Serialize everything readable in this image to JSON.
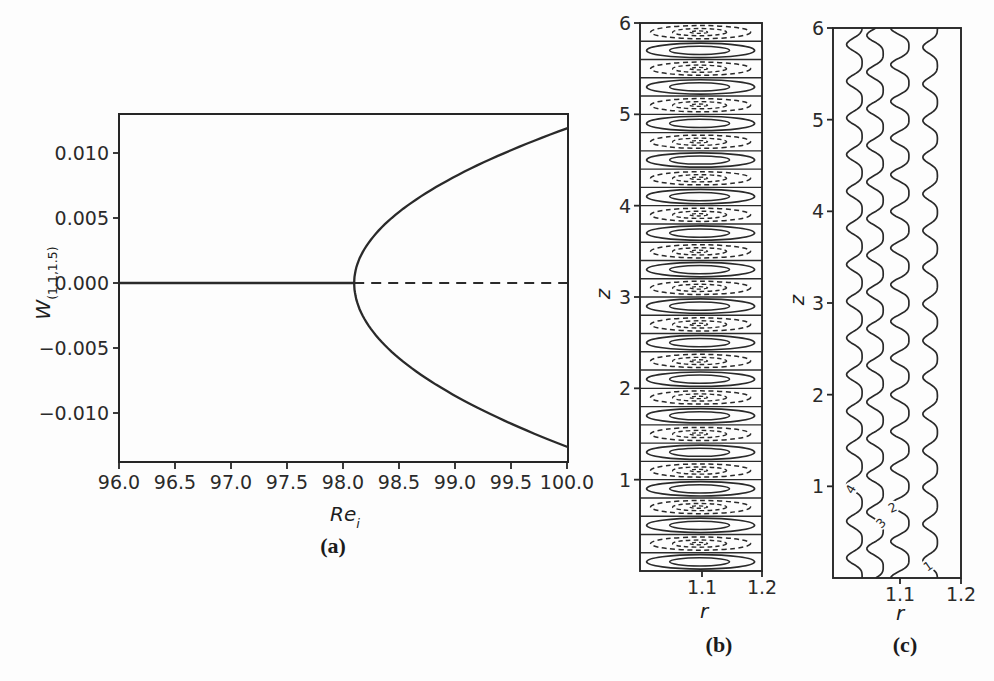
{
  "panels": {
    "a": {
      "caption": "(a)",
      "xlabel": {
        "main": "Re",
        "sub": "i"
      },
      "ylabel": {
        "main": "W",
        "sub": "(1.1,1.5)"
      },
      "xtick_labels": [
        "96.0",
        "96.5",
        "97.0",
        "97.5",
        "98.0",
        "98.5",
        "99.0",
        "99.5",
        "100.0"
      ],
      "ytick_labels": [
        "0.010",
        "0.005",
        "0.000",
        "−0.005",
        "−0.010"
      ]
    },
    "b": {
      "caption": "(b)",
      "xlabel": "r",
      "ylabel": "z",
      "xtick_labels": [
        "1.1",
        "1.2"
      ],
      "ytick_labels": [
        "1",
        "2",
        "3",
        "4",
        "5",
        "6"
      ]
    },
    "c": {
      "caption": "(c)",
      "xlabel": "r",
      "ylabel": "z",
      "xtick_labels": [
        "1.1",
        "1.2"
      ],
      "ytick_labels": [
        "1",
        "2",
        "3",
        "4",
        "5",
        "6"
      ]
    }
  },
  "colors": {
    "line": "#2a2a2a",
    "spine": "#262626",
    "text": "#222222",
    "background": "#fdfdfd"
  },
  "chart_data": [
    {
      "id": "a",
      "type": "line",
      "title": "pitchfork bifurcation diagram",
      "xlabel": "Re_i",
      "ylabel": "W_(1.1,1.5)",
      "xlim": [
        96.0,
        100.0
      ],
      "ylim": [
        -0.0135,
        0.013
      ],
      "xticks": [
        96.0,
        96.5,
        97.0,
        97.5,
        98.0,
        98.5,
        99.0,
        99.5,
        100.0
      ],
      "yticks": [
        0.01,
        0.005,
        0.0,
        -0.005,
        -0.01
      ],
      "bifurcation_Re": 98.1,
      "series": [
        {
          "name": "base-state-stable",
          "style": "solid",
          "points": [
            [
              96.0,
              0.0
            ],
            [
              98.1,
              0.0
            ]
          ]
        },
        {
          "name": "base-state-unstable",
          "style": "dashed",
          "points": [
            [
              98.1,
              0.0
            ],
            [
              100.0,
              0.0
            ]
          ]
        },
        {
          "name": "bifurcated-branch-upper",
          "style": "solid",
          "equation": "W = 0.0119*sqrt((Re-98.1)/1.9)",
          "points": [
            [
              98.1,
              0.0
            ],
            [
              98.2,
              0.00273
            ],
            [
              98.5,
              0.00546
            ],
            [
              99.0,
              0.00819
            ],
            [
              99.5,
              0.01017
            ],
            [
              100.0,
              0.0119
            ]
          ]
        },
        {
          "name": "bifurcated-branch-lower",
          "style": "solid",
          "equation": "W = -0.0126*sqrt((Re-98.1)/1.9)",
          "points": [
            [
              98.1,
              0.0
            ],
            [
              98.2,
              -0.00289
            ],
            [
              98.5,
              -0.00578
            ],
            [
              99.0,
              -0.00867
            ],
            [
              99.5,
              -0.01077
            ],
            [
              100.0,
              -0.0126
            ]
          ]
        }
      ]
    },
    {
      "id": "b",
      "type": "contour",
      "title": "Taylor vortex streamfunction contours",
      "xlabel": "r",
      "ylabel": "z",
      "xlim": [
        1.0,
        1.2
      ],
      "ylim": [
        0,
        6
      ],
      "xticks": [
        1.1,
        1.2
      ],
      "yticks": [
        1,
        2,
        3,
        4,
        5,
        6
      ],
      "cells": {
        "count": 30,
        "z_height": 0.2,
        "bottom_cell_style": "solid",
        "alternating": [
          "solid",
          "dashed"
        ],
        "ellipse_center_r": 1.096,
        "levels_solid": 2,
        "levels_dashed": 3
      }
    },
    {
      "id": "c",
      "type": "contour",
      "title": "wavy azimuthal-velocity contours",
      "xlabel": "r",
      "ylabel": "z",
      "xlim": [
        1.0,
        1.2
      ],
      "ylim": [
        0,
        6
      ],
      "xticks": [
        1.1,
        1.2
      ],
      "yticks": [
        1,
        2,
        3,
        4,
        5,
        6
      ],
      "wavelength_z": 0.4,
      "curves": [
        {
          "label": "4",
          "r_center": 1.028,
          "amplitude_r": 0.014,
          "phase_z": 0.22,
          "label_z": 0.97,
          "label_rot": -60
        },
        {
          "label": "3",
          "r_center": 1.062,
          "amplitude_r": 0.0148,
          "phase_z": 0.32,
          "label_z": 0.6,
          "label_rot": -45
        },
        {
          "label": "2",
          "r_center": 1.103,
          "amplitude_r": 0.0164,
          "phase_z": 0.4,
          "label_z": 0.77,
          "label_rot": -25
        },
        {
          "label": "1",
          "r_center": 1.152,
          "amplitude_r": 0.0131,
          "phase_z": 0.19,
          "label_z": 0.13,
          "label_rot": -35
        }
      ]
    }
  ]
}
